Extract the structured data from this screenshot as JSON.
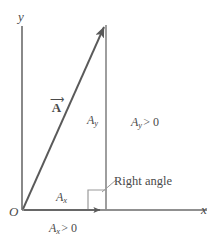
{
  "figure": {
    "background_color": "#ffffff",
    "stroke_color": "#6b6b6b",
    "text_color": "#4a4a4a"
  },
  "axes": {
    "y_label": "y",
    "x_label": "x",
    "origin_label": "O"
  },
  "vector": {
    "symbol": "A",
    "accent": "⟶",
    "tip_x": 106,
    "tip_y": 23
  },
  "components": {
    "y_component_label": "A",
    "y_component_sub": "y",
    "x_component_label": "A",
    "x_component_sub": "x"
  },
  "annotations": {
    "ay_positive": {
      "symbol": "A",
      "sub": "y",
      "relation": "> 0"
    },
    "ax_positive": {
      "symbol": "A",
      "sub": "x",
      "relation": "> 0"
    },
    "right_angle": "Right angle"
  }
}
